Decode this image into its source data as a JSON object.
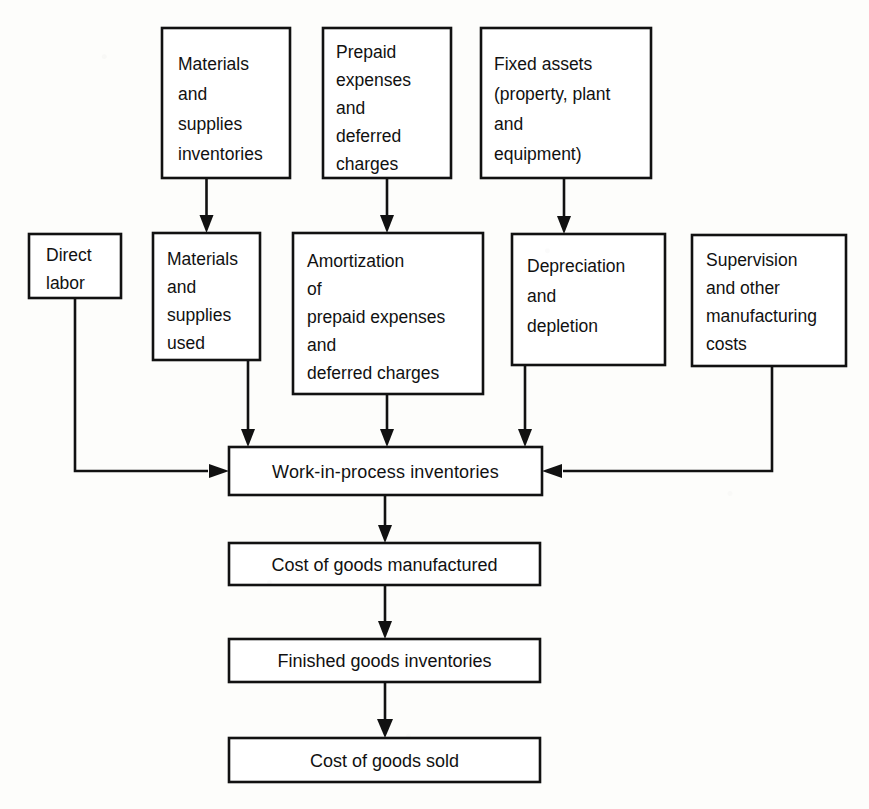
{
  "diagram": {
    "kind": "flowchart",
    "title_partial_cropped": "",
    "ink_color": "#111111",
    "paper_color": "#fdfdfb",
    "nodes": [
      {
        "id": "materials-supplies-inventories",
        "lines": [
          "Materials",
          "and",
          "supplies",
          "inventories"
        ],
        "align": "left",
        "x": 162,
        "y": 28,
        "w": 128,
        "h": 150
      },
      {
        "id": "prepaid-expenses-deferred-charges",
        "lines": [
          "Prepaid",
          "expenses",
          "and",
          "deferred",
          "charges"
        ],
        "align": "left",
        "x": 323,
        "y": 28,
        "w": 128,
        "h": 150
      },
      {
        "id": "fixed-assets",
        "lines": [
          "Fixed assets",
          "(property, plant",
          "and",
          "equipment)"
        ],
        "align": "left",
        "x": 481,
        "y": 28,
        "w": 170,
        "h": 150
      },
      {
        "id": "direct-labor",
        "lines": [
          "Direct",
          "labor"
        ],
        "align": "left",
        "x": 29,
        "y": 234,
        "w": 92,
        "h": 64
      },
      {
        "id": "materials-supplies-used",
        "lines": [
          "Materials",
          "and",
          "supplies",
          "used"
        ],
        "align": "left",
        "x": 153,
        "y": 233,
        "w": 107,
        "h": 127
      },
      {
        "id": "amortization-prepaid-deferred",
        "lines": [
          "Amortization",
          "of",
          "prepaid expenses",
          "and",
          "deferred charges"
        ],
        "align": "left",
        "x": 293,
        "y": 233,
        "w": 190,
        "h": 161
      },
      {
        "id": "depreciation-depletion",
        "lines": [
          "Depreciation",
          "and",
          "depletion"
        ],
        "align": "left",
        "x": 512,
        "y": 234,
        "w": 153,
        "h": 131
      },
      {
        "id": "supervision-other-manufacturing-costs",
        "lines": [
          "Supervision",
          "and other",
          "manufacturing",
          "costs"
        ],
        "align": "left",
        "x": 692,
        "y": 235,
        "w": 154,
        "h": 131
      },
      {
        "id": "work-in-process-inventories",
        "lines": [
          "Work-in-process  inventories"
        ],
        "align": "center",
        "x": 229,
        "y": 447,
        "w": 313,
        "h": 48
      },
      {
        "id": "cost-of-goods-manufactured",
        "lines": [
          "Cost of goods manufactured"
        ],
        "align": "center",
        "x": 229,
        "y": 543,
        "w": 311,
        "h": 42
      },
      {
        "id": "finished-goods-inventories",
        "lines": [
          "Finished goods inventories"
        ],
        "align": "center",
        "x": 229,
        "y": 639,
        "w": 311,
        "h": 43
      },
      {
        "id": "cost-of-goods-sold",
        "lines": [
          "Cost of goods sold"
        ],
        "align": "center",
        "x": 229,
        "y": 738,
        "w": 311,
        "h": 44
      }
    ],
    "edges": [
      {
        "id": "edge-materials-inventories-to-used",
        "from": "materials-supplies-inventories",
        "to": "materials-supplies-used",
        "shape": "vertical"
      },
      {
        "id": "edge-prepaid-to-amortization",
        "from": "prepaid-expenses-deferred-charges",
        "to": "amortization-prepaid-deferred",
        "shape": "vertical"
      },
      {
        "id": "edge-fixed-assets-to-depreciation",
        "from": "fixed-assets",
        "to": "depreciation-depletion",
        "shape": "vertical"
      },
      {
        "id": "edge-direct-labor-to-wip",
        "from": "direct-labor",
        "to": "work-in-process-inventories",
        "shape": "down-then-right"
      },
      {
        "id": "edge-materials-used-to-wip",
        "from": "materials-supplies-used",
        "to": "work-in-process-inventories",
        "shape": "vertical"
      },
      {
        "id": "edge-amortization-to-wip",
        "from": "amortization-prepaid-deferred",
        "to": "work-in-process-inventories",
        "shape": "vertical"
      },
      {
        "id": "edge-depreciation-to-wip",
        "from": "depreciation-depletion",
        "to": "work-in-process-inventories",
        "shape": "vertical"
      },
      {
        "id": "edge-supervision-to-wip",
        "from": "supervision-other-manufacturing-costs",
        "to": "work-in-process-inventories",
        "shape": "down-then-left"
      },
      {
        "id": "edge-wip-to-cogm",
        "from": "work-in-process-inventories",
        "to": "cost-of-goods-manufactured",
        "shape": "vertical"
      },
      {
        "id": "edge-cogm-to-fg",
        "from": "cost-of-goods-manufactured",
        "to": "finished-goods-inventories",
        "shape": "vertical"
      },
      {
        "id": "edge-fg-to-cogs",
        "from": "finished-goods-inventories",
        "to": "cost-of-goods-sold",
        "shape": "vertical"
      }
    ]
  }
}
